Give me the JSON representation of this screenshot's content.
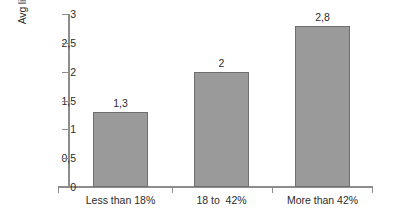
{
  "chart_data": {
    "type": "bar",
    "title": "",
    "xlabel": "",
    "ylabel": "Avg licenses perproducer",
    "categories": [
      "Less than 18%",
      "18 to  42%",
      "More than 42%"
    ],
    "values": [
      1.3,
      2,
      2.8
    ],
    "value_labels": [
      "1,3",
      "2",
      "2,8"
    ],
    "ylim": [
      0,
      3
    ],
    "yticks": [
      0,
      0.5,
      1,
      1.5,
      2,
      2.5,
      3
    ],
    "ytick_labels": [
      "0",
      "0,5",
      "1",
      "1,5",
      "2",
      "2,5",
      "3"
    ],
    "decimal_separator": ",",
    "grid": false,
    "legend": false,
    "legend_position": "none",
    "bar_fill_color": "#9a9a9a",
    "bar_border_color": "#6f6f6f",
    "axis_color": "#8d8d8d",
    "text_color": "#2b2b2b",
    "background_color": "#ffffff"
  }
}
